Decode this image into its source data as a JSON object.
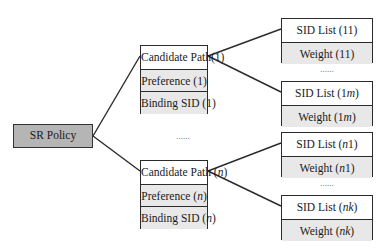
{
  "diagram": {
    "root": {
      "label": "SR Policy",
      "fill": "#b5b5b5"
    },
    "ellipsis": "......",
    "candidate_paths": [
      {
        "id": "cp1",
        "rows": [
          "Candidate Path(1)",
          "Preference (1)",
          "Binding SID (1)"
        ],
        "sid_lists": [
          {
            "rows": [
              "SID List (11)",
              "Weight (11)"
            ]
          },
          {
            "rows": [
              "SID List (1m)",
              "Weight (1m)"
            ]
          }
        ]
      },
      {
        "id": "cpn",
        "rows": [
          "Candidate Path (n)",
          "Preference (n)",
          "Binding SID (n)"
        ],
        "sid_lists": [
          {
            "rows": [
              "SID List (n1)",
              "Weight (n1)"
            ]
          },
          {
            "rows": [
              "SID List (nk)",
              "Weight (nk)"
            ]
          }
        ]
      }
    ],
    "colors": {
      "border": "#2b2b2b",
      "header_row": "#ffffff",
      "grey_row": "#e8e8e8",
      "root_fill": "#b5b5b5"
    }
  }
}
